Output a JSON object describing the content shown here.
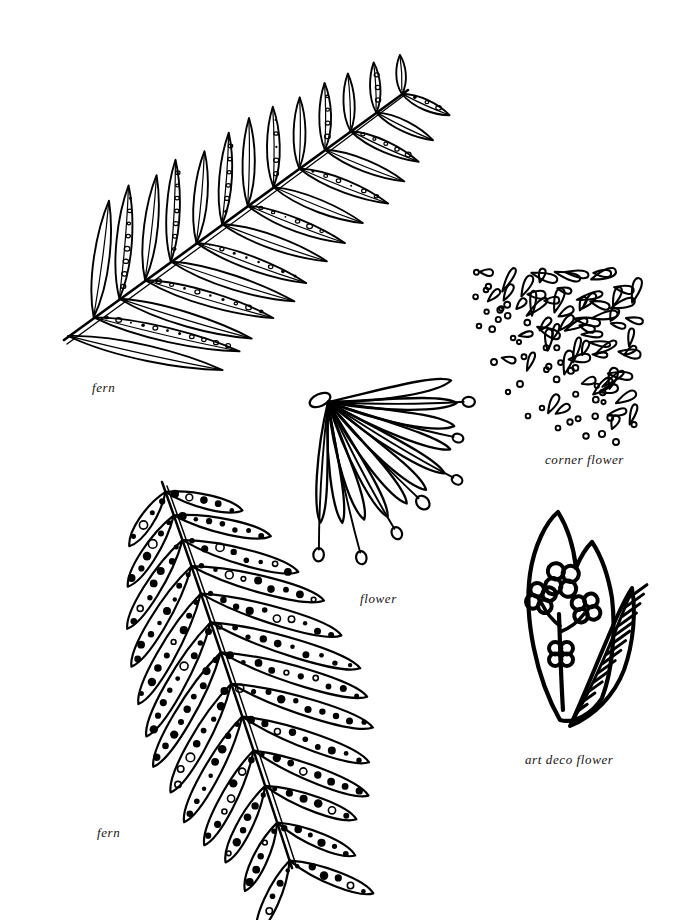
{
  "page": {
    "background_color": "#ffffff",
    "ink_color": "#000000",
    "width": 680,
    "height": 920,
    "kind": "botanical line-art motif sheet",
    "motif_count": 5
  },
  "motifs": [
    {
      "id": "fern-top",
      "caption": "fern",
      "description": "Pinnate fern frond with diagonal rachis and outlined leaflets bearing small oval sori",
      "leaflet_count": 26,
      "fill_style": "open-circles"
    },
    {
      "id": "corner-flower",
      "caption": "corner flower",
      "description": "Corner spray of teardrop petals densest at upper right, thinning to small open circles toward the lower-left diagonal",
      "petal_count": 44,
      "dot_count": 14,
      "fill_style": "outline"
    },
    {
      "id": "flower",
      "caption": "flower",
      "description": "Fan of long narrow petals radiating from a single point with thin stamens tipped by small oval knobs",
      "petal_count": 11,
      "stamen_count": 7,
      "fill_style": "outline"
    },
    {
      "id": "fern-bottom",
      "caption": "fern",
      "description": "Curved fern frond with rounded-tip leaflets filled with solid spore dots",
      "leaflet_count": 26,
      "fill_style": "solid-dots"
    },
    {
      "id": "art-deco-flower",
      "caption": "art deco flower",
      "description": "Twin-peaked leaf outline enclosing a four-blossom sprig, with a chevron-hatched leaf at the right",
      "blossom_count": 4,
      "fill_style": "solid-outline"
    }
  ],
  "captions": {
    "fern_top": "fern",
    "corner_flower": "corner flower",
    "flower": "flower",
    "art_deco_flower": "art deco flower",
    "fern_bottom": "fern"
  }
}
